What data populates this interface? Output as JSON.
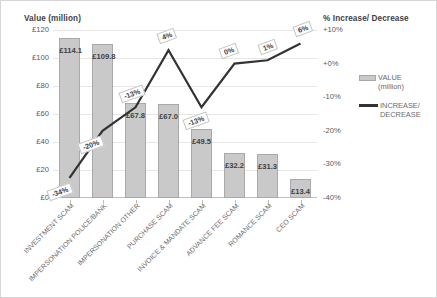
{
  "chart_data": {
    "type": "bar",
    "title": "",
    "categories": [
      "INVESTMENT SCAM",
      "IMPERSONATION POLICE/BANK",
      "IMPERSONATION OTHER",
      "PURCHASE SCAM",
      "INVOICE & MANDATE SCAM",
      "ADVANCE FEE SCAM",
      "ROMANCE SCAM",
      "CEO SCAM"
    ],
    "series": [
      {
        "name": "VALUE (million)",
        "type": "bar",
        "axis": "left",
        "values": [
          114.1,
          109.8,
          67.8,
          67.0,
          49.5,
          32.2,
          31.3,
          13.4
        ],
        "labels": [
          "£114.1",
          "£109.8",
          "£67.8",
          "£67.0",
          "£49.5",
          "£32.2",
          "£31.3",
          "£13.4"
        ],
        "color": "#c9c9c9"
      },
      {
        "name": "INCREASE/ DECREASE",
        "type": "line",
        "axis": "right",
        "values": [
          -34,
          -20,
          -13,
          4,
          -13,
          0,
          1,
          6
        ],
        "labels": [
          "-34%",
          "-20%",
          "-13%",
          "4%",
          "-13%",
          "0%",
          "1%",
          "6%"
        ],
        "color": "#333333"
      }
    ],
    "left_axis": {
      "label": "Value (million)",
      "ticks": [
        "£0",
        "£20",
        "£40",
        "£60",
        "£80",
        "£100",
        "£120"
      ],
      "min": 0,
      "max": 120,
      "step": 20
    },
    "right_axis": {
      "label": "% Increase/ Decrease",
      "ticks": [
        "-40%",
        "-30%",
        "-20%",
        "-10%",
        "+0%",
        "+10%"
      ],
      "min": -40,
      "max": 10,
      "step": 10
    },
    "legend": {
      "position": "right",
      "entries": [
        {
          "label_line1": "VALUE",
          "label_line2": "(million)",
          "marker": "bar-swatch"
        },
        {
          "label_line1": "INCREASE/",
          "label_line2": "DECREASE",
          "marker": "line-swatch"
        }
      ]
    },
    "grid": true,
    "xlabel": "",
    "ylabel": "Value (million)"
  }
}
